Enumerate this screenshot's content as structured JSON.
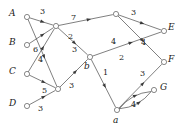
{
  "diagram": {
    "kind": "directed-flow-network",
    "width": 179,
    "height": 128,
    "stroke_color": "#3a3a3a",
    "node_fill": "#ffffff",
    "text_color": "#1a1a1a",
    "nodes": [
      {
        "id": "A",
        "label": "A",
        "x": 27,
        "y": 17,
        "label_x": 9,
        "label_y": 9,
        "shown": true,
        "role": "source"
      },
      {
        "id": "B",
        "label": "B",
        "x": 27,
        "y": 45,
        "label_x": 9,
        "label_y": 38,
        "shown": true,
        "role": "source"
      },
      {
        "id": "C",
        "label": "C",
        "x": 27,
        "y": 74,
        "label_x": 9,
        "label_y": 67,
        "shown": true,
        "role": "source"
      },
      {
        "id": "D",
        "label": "D",
        "x": 27,
        "y": 106,
        "label_x": 9,
        "label_y": 99,
        "shown": true,
        "role": "source"
      },
      {
        "id": "m1",
        "label": "",
        "x": 56,
        "y": 26,
        "label_x": 0,
        "label_y": 0,
        "shown": false,
        "role": "intermediate"
      },
      {
        "id": "m2",
        "label": "",
        "x": 58,
        "y": 89,
        "label_x": 0,
        "label_y": 0,
        "shown": false,
        "role": "intermediate"
      },
      {
        "id": "t",
        "label": "",
        "x": 116,
        "y": 14,
        "label_x": 0,
        "label_y": 0,
        "shown": false,
        "role": "intermediate"
      },
      {
        "id": "b",
        "label": "b",
        "x": 90,
        "y": 57,
        "label_x": 84,
        "label_y": 62,
        "shown": true,
        "role": "intermediate"
      },
      {
        "id": "a",
        "label": "a",
        "x": 117,
        "y": 110,
        "label_x": 113,
        "label_y": 116,
        "shown": true,
        "role": "intermediate"
      },
      {
        "id": "E",
        "label": "E",
        "x": 164,
        "y": 31,
        "label_x": 168,
        "label_y": 23,
        "shown": true,
        "role": "sink"
      },
      {
        "id": "F",
        "label": "F",
        "x": 164,
        "y": 62,
        "label_x": 168,
        "label_y": 55,
        "shown": true,
        "role": "sink"
      },
      {
        "id": "G",
        "label": "G",
        "x": 154,
        "y": 90,
        "label_x": 160,
        "label_y": 83,
        "shown": true,
        "role": "sink"
      }
    ],
    "edges": [
      {
        "id": "e1",
        "from": "A",
        "to": "m1",
        "capacity": "3",
        "label_x": 40,
        "label_y": 8
      },
      {
        "id": "e2",
        "from": "A",
        "to": "m2",
        "capacity": "3",
        "label_x": 69,
        "label_y": 82
      },
      {
        "id": "e3",
        "from": "B",
        "to": "m1",
        "capacity": "6",
        "label_x": 33,
        "label_y": 46
      },
      {
        "id": "e4",
        "from": "C",
        "to": "m1",
        "capacity": "4",
        "label_x": 38,
        "label_y": 56
      },
      {
        "id": "e5",
        "from": "C",
        "to": "m2",
        "capacity": "5",
        "label_x": 42,
        "label_y": 87
      },
      {
        "id": "e6",
        "from": "D",
        "to": "m2",
        "capacity": "3",
        "label_x": 38,
        "label_y": 105
      },
      {
        "id": "e7",
        "from": "m1",
        "to": "t",
        "capacity": "7",
        "label_x": 71,
        "label_y": 14
      },
      {
        "id": "e8",
        "from": "m1",
        "to": "b",
        "capacity": "2",
        "label_x": 68,
        "label_y": 33
      },
      {
        "id": "e9",
        "from": "m2",
        "to": "b",
        "capacity": "3",
        "label_x": 72,
        "label_y": 46
      },
      {
        "id": "e10",
        "from": "t",
        "to": "E",
        "capacity": "3",
        "label_x": 131,
        "label_y": 9
      },
      {
        "id": "e11",
        "from": "t",
        "to": "F",
        "capacity": "4",
        "label_x": 141,
        "label_y": 39
      },
      {
        "id": "e12",
        "from": "b",
        "to": "E",
        "capacity": "4",
        "label_x": 111,
        "label_y": 38
      },
      {
        "id": "e13",
        "from": "b",
        "to": "a",
        "capacity": "1",
        "label_x": 103,
        "label_y": 69
      },
      {
        "id": "e14",
        "from": "a",
        "to": "F",
        "capacity": "2",
        "label_x": 119,
        "label_y": 54
      },
      {
        "id": "e15",
        "from": "a",
        "to": "G",
        "capacity": "3",
        "label_x": 140,
        "label_y": 70
      },
      {
        "id": "e16",
        "from": "a",
        "to": "G",
        "capacity": "4",
        "label_x": 131,
        "label_y": 101
      }
    ]
  }
}
